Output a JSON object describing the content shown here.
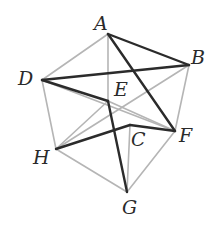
{
  "figure": {
    "colors": {
      "dark": "#2b2b2b",
      "light": "#b5b5b5"
    },
    "vertices": {
      "A": [
        108,
        34
      ],
      "B": [
        189,
        65
      ],
      "D": [
        42,
        80
      ],
      "E": [
        108,
        101
      ],
      "C": [
        130,
        125
      ],
      "F": [
        175,
        131
      ],
      "H": [
        56,
        149
      ],
      "G": [
        127,
        192
      ]
    },
    "labels": [
      {
        "text": "A",
        "x": 94,
        "y": 14
      },
      {
        "text": "B",
        "x": 191,
        "y": 48
      },
      {
        "text": "D",
        "x": 18,
        "y": 69
      },
      {
        "text": "E",
        "x": 114,
        "y": 80
      },
      {
        "text": "C",
        "x": 131,
        "y": 130
      },
      {
        "text": "F",
        "x": 179,
        "y": 126
      },
      {
        "text": "H",
        "x": 33,
        "y": 148
      },
      {
        "text": "G",
        "x": 122,
        "y": 198
      }
    ],
    "light_edges": [
      [
        "A",
        "D"
      ],
      [
        "A",
        "E"
      ],
      [
        "D",
        "H"
      ],
      [
        "D",
        "F"
      ],
      [
        "E",
        "F"
      ],
      [
        "H",
        "B"
      ],
      [
        "B",
        "F"
      ],
      [
        "H",
        "G"
      ],
      [
        "G",
        "F"
      ],
      [
        "C",
        "G"
      ],
      [
        "E",
        "H"
      ]
    ],
    "dark_edges": [
      [
        "A",
        "B"
      ],
      [
        "A",
        "F"
      ],
      [
        "D",
        "B"
      ],
      [
        "D",
        "E"
      ],
      [
        "E",
        "G"
      ],
      [
        "H",
        "C"
      ],
      [
        "C",
        "F"
      ]
    ]
  }
}
